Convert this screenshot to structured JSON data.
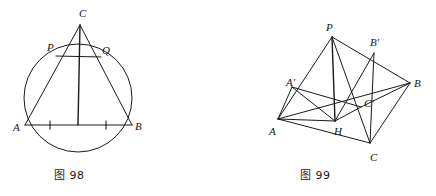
{
  "document": {
    "background_color": "#ffffff",
    "ink_color": "#1a1a1a",
    "width": 436,
    "height": 196
  },
  "figures": [
    {
      "id": "fig-98",
      "caption": "图 98",
      "caption_number": "98",
      "type": "circle-inscribed-triangle",
      "description": "Circle with horizontal diameter AB, apex C outside above the circle, cevians CA and CB meeting the circle at P and Q, altitude from C to midpoint of AB, chord PQ, and two congruence tick marks on AB.",
      "labels": [
        {
          "name": "C",
          "text": "C",
          "x": 79,
          "y": 8
        },
        {
          "name": "P",
          "text": "P",
          "x": 47,
          "y": 42
        },
        {
          "name": "Q",
          "text": "Q",
          "x": 102,
          "y": 45
        },
        {
          "name": "A",
          "text": "A",
          "x": 13,
          "y": 122
        },
        {
          "name": "B",
          "text": "B",
          "x": 135,
          "y": 121
        }
      ],
      "points": {
        "C": {
          "x": 80,
          "y": 25
        },
        "P": {
          "x": 56,
          "y": 56
        },
        "Q": {
          "x": 101,
          "y": 57
        },
        "A": {
          "x": 25,
          "y": 125
        },
        "B": {
          "x": 132,
          "y": 125
        },
        "M": {
          "x": 78,
          "y": 125
        }
      },
      "circle": {
        "cx": 78,
        "cy": 98,
        "r": 54
      },
      "segments": [
        {
          "name": "side-CA",
          "from": "C",
          "to": "A"
        },
        {
          "name": "side-CB",
          "from": "C",
          "to": "B"
        },
        {
          "name": "base-AB",
          "from": "A",
          "to": "B"
        },
        {
          "name": "chord-PQ",
          "from": "P",
          "to": "Q"
        },
        {
          "name": "altitude-CM",
          "from": "C",
          "to": "M"
        }
      ],
      "tick_marks": [
        {
          "name": "tick-AM",
          "x": 50,
          "y": 125
        },
        {
          "name": "tick-MB",
          "x": 106,
          "y": 125
        }
      ]
    },
    {
      "id": "fig-99",
      "caption": "图 99",
      "caption_number": "99",
      "type": "triangle-orthocenter-pedal",
      "description": "Triangle ABC with interior point H, apex P above, pedal/foot points A', B', C' on the sides, with cevians and connecting segments forming a network.",
      "labels": [
        {
          "name": "P",
          "text": "P",
          "x": 108,
          "y": 22
        },
        {
          "name": "B-prime",
          "text": "B'",
          "x": 152,
          "y": 37
        },
        {
          "name": "A-prime",
          "text": "A'",
          "x": 68,
          "y": 77
        },
        {
          "name": "B",
          "text": "B",
          "x": 196,
          "y": 78
        },
        {
          "name": "C-prime",
          "text": "C'",
          "x": 146,
          "y": 98
        },
        {
          "name": "A",
          "text": "A",
          "x": 51,
          "y": 126
        },
        {
          "name": "H",
          "text": "H",
          "x": 116,
          "y": 126
        },
        {
          "name": "C",
          "text": "C",
          "x": 152,
          "y": 152
        }
      ],
      "points": {
        "P": {
          "x": 114,
          "y": 37
        },
        "Bp": {
          "x": 156,
          "y": 53
        },
        "B": {
          "x": 192,
          "y": 83
        },
        "Ap": {
          "x": 74,
          "y": 87
        },
        "Cp": {
          "x": 143,
          "y": 107
        },
        "A": {
          "x": 60,
          "y": 119
        },
        "H": {
          "x": 117,
          "y": 121
        },
        "C": {
          "x": 152,
          "y": 143
        }
      },
      "segments": [
        {
          "name": "edge-PA",
          "from": "P",
          "to": "A"
        },
        {
          "name": "edge-PB",
          "from": "P",
          "to": "B"
        },
        {
          "name": "edge-PH",
          "from": "P",
          "to": "H"
        },
        {
          "name": "edge-PC",
          "from": "P",
          "to": "C"
        },
        {
          "name": "edge-AB",
          "from": "A",
          "to": "B"
        },
        {
          "name": "edge-AC",
          "from": "A",
          "to": "C"
        },
        {
          "name": "edge-BC",
          "from": "B",
          "to": "C"
        },
        {
          "name": "edge-A-Ap",
          "from": "A",
          "to": "Ap"
        },
        {
          "name": "edge-Ap-H",
          "from": "Ap",
          "to": "H"
        },
        {
          "name": "edge-Ap-Cp",
          "from": "Ap",
          "to": "Cp"
        },
        {
          "name": "edge-Cp-B",
          "from": "Cp",
          "to": "B"
        },
        {
          "name": "edge-H-Cp",
          "from": "H",
          "to": "Cp"
        },
        {
          "name": "edge-Bp-H",
          "from": "Bp",
          "to": "H"
        },
        {
          "name": "edge-Bp-C",
          "from": "Bp",
          "to": "C"
        },
        {
          "name": "edge-A-H",
          "from": "A",
          "to": "H"
        }
      ]
    }
  ]
}
